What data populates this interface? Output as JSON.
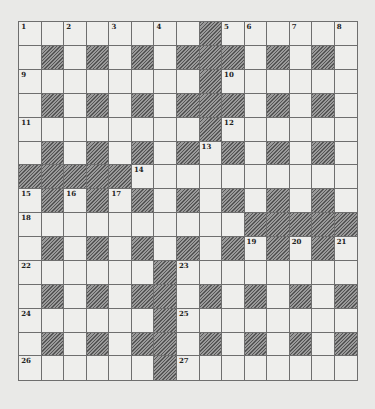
{
  "puzzle": {
    "size": 15,
    "rows": [
      "........#......",
      ".#.#.#.###.#.#.",
      "........#......",
      ".#.#.#.###.#.#.",
      "........#......",
      ".#.#.#.#.#.#.#.",
      "#####..........",
      ".#.#.#.#.#.#.#.",
      "..........#####",
      ".#.#.#.#.#.#.#.",
      "......#........",
      ".#.#.##.#.#.#.#",
      "......#........",
      ".#.#.##.#.#.#.#",
      "......#........"
    ],
    "numbers": [
      {
        "r": 0,
        "c": 0,
        "n": "1"
      },
      {
        "r": 0,
        "c": 2,
        "n": "2"
      },
      {
        "r": 0,
        "c": 4,
        "n": "3"
      },
      {
        "r": 0,
        "c": 6,
        "n": "4"
      },
      {
        "r": 0,
        "c": 9,
        "n": "5"
      },
      {
        "r": 0,
        "c": 10,
        "n": "6"
      },
      {
        "r": 0,
        "c": 12,
        "n": "7"
      },
      {
        "r": 0,
        "c": 14,
        "n": "8"
      },
      {
        "r": 2,
        "c": 0,
        "n": "9"
      },
      {
        "r": 2,
        "c": 9,
        "n": "10"
      },
      {
        "r": 4,
        "c": 0,
        "n": "11"
      },
      {
        "r": 4,
        "c": 9,
        "n": "12"
      },
      {
        "r": 5,
        "c": 8,
        "n": "13"
      },
      {
        "r": 6,
        "c": 5,
        "n": "14"
      },
      {
        "r": 7,
        "c": 0,
        "n": "15"
      },
      {
        "r": 7,
        "c": 2,
        "n": "16"
      },
      {
        "r": 7,
        "c": 4,
        "n": "17"
      },
      {
        "r": 8,
        "c": 0,
        "n": "18"
      },
      {
        "r": 9,
        "c": 10,
        "n": "19"
      },
      {
        "r": 9,
        "c": 12,
        "n": "20"
      },
      {
        "r": 9,
        "c": 14,
        "n": "21"
      },
      {
        "r": 10,
        "c": 0,
        "n": "22"
      },
      {
        "r": 10,
        "c": 7,
        "n": "23"
      },
      {
        "r": 12,
        "c": 0,
        "n": "24"
      },
      {
        "r": 12,
        "c": 7,
        "n": "25"
      },
      {
        "r": 14,
        "c": 0,
        "n": "26"
      },
      {
        "r": 14,
        "c": 7,
        "n": "27"
      }
    ]
  },
  "colors": {
    "background": "#e9e9e7",
    "cell": "#eeeeec",
    "border": "#6e6e6e",
    "block": "#7a7a7a"
  }
}
